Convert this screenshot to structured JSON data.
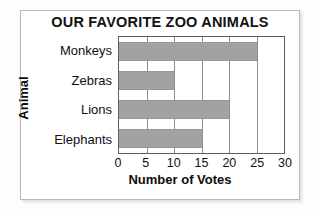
{
  "chart_data": {
    "type": "bar",
    "orientation": "horizontal",
    "title": "OUR FAVORITE ZOO ANIMALS",
    "xlabel": "Number of Votes",
    "ylabel": "Animal",
    "categories": [
      "Monkeys",
      "Zebras",
      "Lions",
      "Elephants"
    ],
    "values": [
      25,
      10,
      20,
      15
    ],
    "xticks": [
      0,
      5,
      10,
      15,
      20,
      25,
      30
    ],
    "xlim": [
      0,
      30
    ],
    "grid": true,
    "legend": false,
    "bar_color": "#a2a2a2",
    "axis_color": "#5e5e5e",
    "text_color": "#101010"
  }
}
